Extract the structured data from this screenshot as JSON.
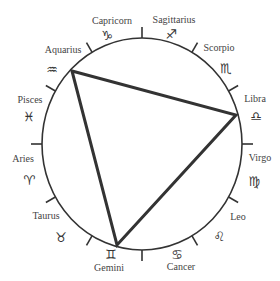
{
  "diagram": {
    "type": "zodiac-wheel",
    "circle": {
      "cx": 142,
      "cy": 144,
      "rx": 100,
      "ry": 106,
      "stroke": "#333333"
    },
    "triangle": {
      "vertices": [
        "Aquarius",
        "Libra",
        "Gemini"
      ],
      "points": [
        [
          72,
          71
        ],
        [
          236,
          115
        ],
        [
          117,
          245
        ]
      ],
      "stroke": "#333333"
    },
    "signs": [
      {
        "name": "Capricorn",
        "symbol": "♑",
        "label_xy": [
          112,
          20
        ],
        "symbol_xy": [
          107,
          35
        ]
      },
      {
        "name": "Sagittarius",
        "symbol": "♐",
        "label_xy": [
          174,
          19
        ],
        "symbol_xy": [
          171,
          34
        ]
      },
      {
        "name": "Scorpio",
        "symbol": "♏",
        "label_xy": [
          219,
          47
        ],
        "symbol_xy": [
          226,
          68
        ]
      },
      {
        "name": "Libra",
        "symbol": "♎",
        "label_xy": [
          255,
          98
        ],
        "symbol_xy": [
          256,
          116
        ]
      },
      {
        "name": "Virgo",
        "symbol": "♍",
        "label_xy": [
          260,
          157
        ],
        "symbol_xy": [
          254,
          181
        ]
      },
      {
        "name": "Leo",
        "symbol": "♌",
        "label_xy": [
          238,
          216
        ],
        "symbol_xy": [
          219,
          236
        ]
      },
      {
        "name": "Cancer",
        "symbol": "♋",
        "label_xy": [
          181,
          266
        ],
        "symbol_xy": [
          177,
          254
        ]
      },
      {
        "name": "Gemini",
        "symbol": "♊",
        "label_xy": [
          109,
          267
        ],
        "symbol_xy": [
          111,
          254
        ]
      },
      {
        "name": "Taurus",
        "symbol": "♉",
        "label_xy": [
          46,
          215
        ],
        "symbol_xy": [
          61,
          237
        ]
      },
      {
        "name": "Aries",
        "symbol": "♈",
        "label_xy": [
          23,
          158
        ],
        "symbol_xy": [
          29,
          180
        ]
      },
      {
        "name": "Pisces",
        "symbol": "♓",
        "label_xy": [
          30,
          99
        ],
        "symbol_xy": [
          29,
          116
        ]
      },
      {
        "name": "Aquarius",
        "symbol": "♒",
        "label_xy": [
          63,
          49
        ],
        "symbol_xy": [
          52,
          69
        ]
      }
    ]
  }
}
